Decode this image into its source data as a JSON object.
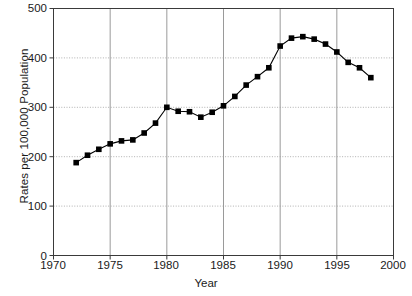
{
  "chart_data": {
    "type": "line",
    "title": "",
    "xlabel": "Year",
    "ylabel": "Rates per 100,000 Population",
    "xlim": [
      1970,
      2000
    ],
    "ylim": [
      0,
      500
    ],
    "xticks": [
      1970,
      1975,
      1980,
      1985,
      1990,
      1995,
      2000
    ],
    "xtick_labels": [
      "1970",
      "1975",
      "1980",
      "1985",
      "1990",
      "1995",
      "2000"
    ],
    "yticks": [
      0,
      100,
      200,
      300,
      400,
      500
    ],
    "ytick_labels": [
      "0",
      "100",
      "200",
      "300",
      "400",
      "500"
    ],
    "grid": true,
    "grid_style": "dotted",
    "legend": null,
    "marker": "square",
    "marker_color": "#000000",
    "line_color": "#000000",
    "x": [
      1972,
      1973,
      1974,
      1975,
      1976,
      1977,
      1978,
      1979,
      1980,
      1981,
      1982,
      1983,
      1984,
      1985,
      1986,
      1987,
      1988,
      1989,
      1990,
      1991,
      1992,
      1993,
      1994,
      1995,
      1996,
      1997,
      1998
    ],
    "values": [
      188,
      203,
      215,
      226,
      232,
      234,
      248,
      268,
      300,
      292,
      291,
      280,
      290,
      303,
      322,
      345,
      362,
      380,
      424,
      440,
      443,
      438,
      428,
      412,
      391,
      380,
      360
    ],
    "series": [
      {
        "name": "Rate",
        "values": [
          188,
          203,
          215,
          226,
          232,
          234,
          248,
          268,
          300,
          292,
          291,
          280,
          290,
          303,
          322,
          345,
          362,
          380,
          424,
          440,
          443,
          438,
          428,
          412,
          391,
          380,
          360
        ]
      }
    ]
  },
  "axes": {
    "y_title": "Rates per 100,000 Population",
    "x_title": "Year"
  }
}
